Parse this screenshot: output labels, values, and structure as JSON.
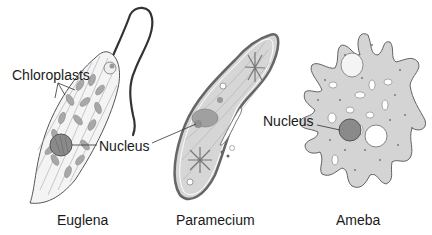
{
  "diagram": {
    "organisms": [
      {
        "id": "euglena",
        "caption": "Euglena"
      },
      {
        "id": "paramecium",
        "caption": "Paramecium"
      },
      {
        "id": "ameba",
        "caption": "Ameba"
      }
    ],
    "labels": {
      "chloroplasts": "Chloroplasts",
      "nucleus_euglena": "Nucleus",
      "nucleus_ameba": "Nucleus"
    },
    "colors": {
      "outline": "#555555",
      "cytoplasm": "#d8d8d8",
      "nucleus": "#8a8a8a",
      "flagellum": "#333333",
      "chloroplast": "#a8a8a8"
    }
  }
}
